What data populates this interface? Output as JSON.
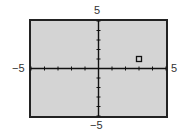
{
  "chart_data": {
    "type": "scatter",
    "title": "",
    "xlabel": "",
    "ylabel": "",
    "xlim": [
      -5,
      5
    ],
    "ylim": [
      -5,
      5
    ],
    "x_tick_step": 1,
    "y_tick_step": 1,
    "grid": false,
    "legend": null,
    "tick_labels": {
      "x_min": "−5",
      "x_max": "5",
      "y_min": "−5",
      "y_max": "5"
    },
    "series": [
      {
        "name": "point",
        "marker": "square",
        "points": [
          {
            "x": 3,
            "y": 1
          }
        ]
      }
    ]
  },
  "colors": {
    "background": "#d4d4d4",
    "frame": "#222222",
    "axis": "#111111",
    "marker": "#111111"
  }
}
